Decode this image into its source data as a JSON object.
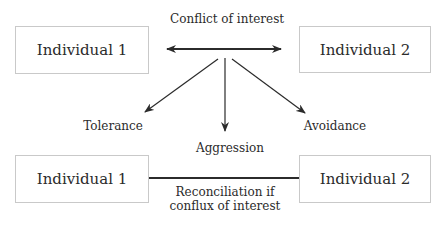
{
  "diagram": {
    "top": {
      "left_box": "Individual 1",
      "right_box": "Individual 2",
      "conflict_label": "Conflict of interest"
    },
    "outcomes": [
      {
        "label": "Tolerance"
      },
      {
        "label": "Aggression"
      },
      {
        "label": "Avoidance"
      }
    ],
    "bottom": {
      "left_box": "Individual 1",
      "right_box": "Individual 2",
      "reconciliation_line1": "Reconciliation if",
      "reconciliation_line2": "conflux of interest"
    },
    "colors": {
      "line": "#2b2b2b",
      "box_border": "#c9c9c9",
      "text": "#2b2b2b"
    }
  }
}
